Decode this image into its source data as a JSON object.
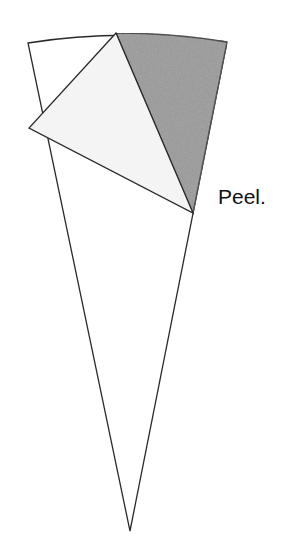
{
  "diagram": {
    "caption": "Peel.",
    "colors": {
      "outline": "#2a2a2a",
      "background": "#ffffff",
      "cone_fill": "#ffffff",
      "peeled_flap_fill": "#f4f4f4",
      "exposed_region_fill": "#9a9a9a"
    },
    "shapes": {
      "cone_sector": {
        "top_left": [
          28,
          43
        ],
        "top_right": [
          227,
          42
        ],
        "bottom_tip": [
          130,
          531
        ]
      },
      "exposed_region": {
        "top_vertex": [
          116,
          33
        ],
        "top_right": [
          227,
          42
        ],
        "bottom_vertex": [
          193,
          213
        ]
      },
      "peeled_flap": {
        "top_vertex": [
          116,
          33
        ],
        "left_tip": [
          29,
          128
        ],
        "bottom_vertex": [
          193,
          213
        ]
      }
    }
  }
}
